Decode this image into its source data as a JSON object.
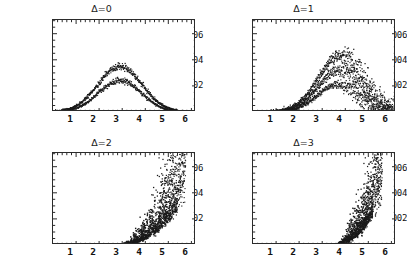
{
  "figure": {
    "background": "#ffffff",
    "ink_color": "#1a1a1a",
    "caption_fragment": ""
  },
  "axes": {
    "y_ticks": [
      "0.002",
      "0.004",
      "0.006"
    ],
    "y_tick_values": [
      0.002,
      0.004,
      0.006
    ],
    "x_ticks": [
      "1",
      "2",
      "3",
      "4",
      "5",
      "6"
    ],
    "x_tick_values": [
      1,
      2,
      3,
      4,
      5,
      6
    ],
    "xlim": [
      0,
      6.2
    ],
    "ylim": [
      0,
      0.00705
    ]
  },
  "chart_data": {
    "type": "scatter",
    "title": "",
    "xlabel": "",
    "ylabel": "",
    "grid": false,
    "legend_position": "none",
    "xlim": [
      0,
      6.2
    ],
    "ylim": [
      0,
      0.00705
    ],
    "x_ticks": [
      1,
      2,
      3,
      4,
      5,
      6
    ],
    "y_ticks": [
      0.002,
      0.004,
      0.006
    ],
    "panel_layout": "2x2",
    "panels": [
      {
        "id": "delta-0",
        "title": "Δ=0",
        "row": 0,
        "col": 0,
        "description": "Two tight overlapping bell-shaped bands peaking near x=2.9; upper band peak ~0.0035, lower band peak ~0.0024. Very low scatter.",
        "series": [
          {
            "name": "upper-band",
            "peak_x": 2.9,
            "peak_y": 0.0035,
            "width": 0.95,
            "spread": 0.00011,
            "points": 330
          },
          {
            "name": "lower-band",
            "peak_x": 2.9,
            "peak_y": 0.00243,
            "width": 0.92,
            "spread": 9e-05,
            "points": 300
          }
        ]
      },
      {
        "id": "delta-1",
        "title": "Δ=1",
        "row": 0,
        "col": 1,
        "description": "Three skewed bands peaking near x=3.8 at ~0.0044, ~0.0033 and ~0.0021, with widening scatter on the falling right flank out to x=5.4.",
        "series": [
          {
            "name": "upper-band",
            "peak_x": 3.8,
            "peak_y": 0.00437,
            "width": 0.95,
            "spread": 0.00022,
            "points": 380
          },
          {
            "name": "middle-band",
            "peak_x": 3.75,
            "peak_y": 0.00325,
            "width": 0.92,
            "spread": 0.00018,
            "points": 340
          },
          {
            "name": "lower-band",
            "peak_x": 3.7,
            "peak_y": 0.00212,
            "width": 0.9,
            "spread": 0.00014,
            "points": 320
          }
        ]
      },
      {
        "id": "delta-2",
        "title": "Δ=2",
        "row": 1,
        "col": 0,
        "description": "Fan-shaped scatter cloud rising steeply from x=3 and spraying upward past the top of the frame between x=4.3 and x=5.6; dense dark lower edge.",
        "series": [
          {
            "name": "fan-cloud",
            "onset_x": 2.95,
            "flare_x": 4.3,
            "max_x": 5.75,
            "top_y": 0.00705,
            "points": 900
          },
          {
            "name": "dense-edge",
            "onset_x": 2.9,
            "flare_x": 4.1,
            "max_x": 5.4,
            "top_y": 0.0026,
            "points": 420
          }
        ]
      },
      {
        "id": "delta-3",
        "title": "Δ=3",
        "row": 1,
        "col": 1,
        "description": "Narrower, later fan: scatter begins near x=3.6, flares vertically between x=4.3 and x=5.5, reaching the top of the frame; very dense dark foot along the baseline.",
        "series": [
          {
            "name": "fan-cloud",
            "onset_x": 3.6,
            "flare_x": 4.35,
            "max_x": 5.6,
            "top_y": 0.00705,
            "points": 820
          },
          {
            "name": "dense-edge",
            "onset_x": 3.5,
            "flare_x": 4.2,
            "max_x": 5.2,
            "top_y": 0.0022,
            "points": 430
          }
        ]
      }
    ]
  }
}
